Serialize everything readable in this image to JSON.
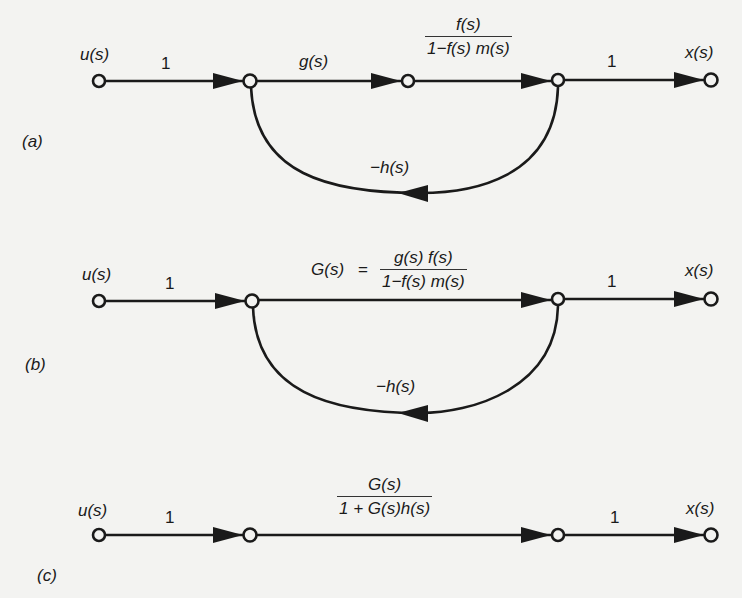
{
  "figure": {
    "background": "#f3f3f1",
    "ink_color": "#1a1a1a",
    "diagrams": [
      {
        "id": "a",
        "panel_label": "(a)",
        "input_label": "u(s)",
        "output_label": "x(s)",
        "branches": [
          {
            "from": "u",
            "to": "n1",
            "gain": "1"
          },
          {
            "from": "n1",
            "to": "n2",
            "gain": "g(s)"
          },
          {
            "from": "n2",
            "to": "n3",
            "gain_numerator": "f(s)",
            "gain_denominator": "1−f(s) m(s)"
          },
          {
            "from": "n3",
            "to": "x",
            "gain": "1"
          },
          {
            "from": "n3",
            "to": "n1",
            "gain": "−h(s)",
            "type": "feedback"
          }
        ]
      },
      {
        "id": "b",
        "panel_label": "(b)",
        "input_label": "u(s)",
        "output_label": "x(s)",
        "branches": [
          {
            "from": "u",
            "to": "n1",
            "gain": "1"
          },
          {
            "from": "n1",
            "to": "n3",
            "gain_prefix": "G(s)",
            "equals": "=",
            "gain_numerator": "g(s) f(s)",
            "gain_denominator": "1−f(s) m(s)"
          },
          {
            "from": "n3",
            "to": "x",
            "gain": "1"
          },
          {
            "from": "n3",
            "to": "n1",
            "gain": "−h(s)",
            "type": "feedback"
          }
        ]
      },
      {
        "id": "c",
        "panel_label": "(c)",
        "input_label": "u(s)",
        "output_label": "x(s)",
        "branches": [
          {
            "from": "u",
            "to": "n1",
            "gain": "1"
          },
          {
            "from": "n1",
            "to": "n3",
            "gain_numerator": "G(s)",
            "gain_denominator": "1 + G(s)h(s)"
          },
          {
            "from": "n3",
            "to": "x",
            "gain": "1"
          }
        ]
      }
    ]
  }
}
